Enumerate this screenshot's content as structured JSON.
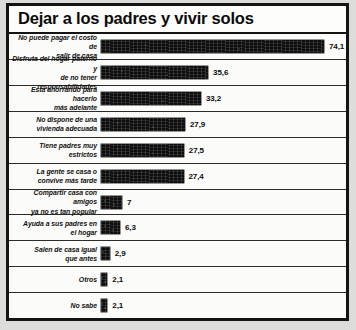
{
  "title": "Dejar a los padres y vivir solos",
  "chart_data": {
    "type": "bar",
    "title": "Dejar a los padres y vivir solos",
    "xlabel": "",
    "ylabel": "",
    "orientation": "horizontal",
    "xlim": [
      0,
      74.1
    ],
    "grid": false,
    "legend": null,
    "value_format": "comma-decimal-percent",
    "categories": [
      "No puede pagar el costo de salir de casa",
      "Disfruta del hogar paterno y de no tener responsabilidades",
      "Está ahorrando para hacerlo más adelante",
      "No dispone de una vivienda adecuada",
      "Tiene padres muy estrictos",
      "La gente se casa o convive más tarde",
      "Compartir casa con amigos ya no es tan popular",
      "Ayuda a sus padres en el hogar",
      "Salen de casa igual que antes",
      "Otros",
      "No sabe"
    ],
    "values": [
      74.1,
      35.6,
      33.2,
      27.9,
      27.5,
      27.4,
      7,
      6.3,
      2.9,
      2.1,
      2.1
    ],
    "value_labels": [
      "74,1",
      "35,6",
      "33,2",
      "27,9",
      "27,5",
      "27,4",
      "7",
      "6,3",
      "2,9",
      "2,1",
      "2,1"
    ]
  },
  "rows": [
    {
      "label_line1": "No puede pagar el costo de",
      "label_line2": "salir de casa",
      "value": 74.1,
      "value_label": "74,1"
    },
    {
      "label_line1": "Disfruta del hogar paterno y",
      "label_line2": "de no tener responsabilidades",
      "value": 35.6,
      "value_label": "35,6"
    },
    {
      "label_line1": "Está ahorrando para hacerlo",
      "label_line2": "más adelante",
      "value": 33.2,
      "value_label": "33,2"
    },
    {
      "label_line1": "No dispone de una",
      "label_line2": "vivienda adecuada",
      "value": 27.9,
      "value_label": "27,9"
    },
    {
      "label_line1": "Tiene padres muy",
      "label_line2": "estrictos",
      "value": 27.5,
      "value_label": "27,5"
    },
    {
      "label_line1": "La gente se casa o",
      "label_line2": "convive más tarde",
      "value": 27.4,
      "value_label": "27,4"
    },
    {
      "label_line1": "Compartir casa con amigos",
      "label_line2": "ya no es tan popular",
      "value": 7,
      "value_label": "7"
    },
    {
      "label_line1": "Ayuda a sus padres en",
      "label_line2": "el hogar",
      "value": 6.3,
      "value_label": "6,3"
    },
    {
      "label_line1": "Salen de casa igual",
      "label_line2": "que antes",
      "value": 2.9,
      "value_label": "2,9"
    },
    {
      "label_line1": "Otros",
      "label_line2": "",
      "value": 2.1,
      "value_label": "2,1"
    },
    {
      "label_line1": "No sabe",
      "label_line2": "",
      "value": 2.1,
      "value_label": "2,1"
    }
  ],
  "colors": {
    "bar": "#0d0d0d",
    "frame": "#141414",
    "panel": "#fbfbf9",
    "page": "#dcdcda",
    "text": "#0b0b0b"
  }
}
